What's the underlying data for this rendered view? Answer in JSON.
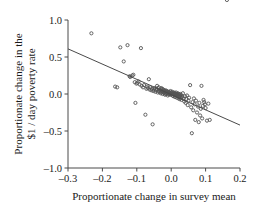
{
  "chart_data": {
    "type": "scatter",
    "title": "",
    "xlabel": "Proportionate change in survey mean",
    "ylabel_line1": "Proportionate change in the",
    "ylabel_line2": "$1 / day poverty rate",
    "xlim": [
      -0.3,
      0.2
    ],
    "ylim": [
      -1.0,
      1.0
    ],
    "xticks": [
      -0.3,
      -0.2,
      -0.1,
      0.0,
      0.1,
      0.2
    ],
    "xticklabels": [
      "–0.3",
      "–0.2",
      "–0.1",
      "0.0",
      "0.1",
      "0.2"
    ],
    "yticks": [
      -1.0,
      -0.5,
      0.0,
      0.5,
      1.0
    ],
    "yticklabels": [
      "–1.0",
      "–0.5",
      "0.0",
      "0.5",
      "1.0"
    ],
    "grid": false,
    "legend": null,
    "marker": "open-circle",
    "marker_color": "#555555",
    "line_color": "#4a4a4a",
    "fit_line": {
      "label": "regression line",
      "x_start": -0.3,
      "y_start": 0.61,
      "x_end": 0.2,
      "y_end": -0.42,
      "slope": -2.06,
      "intercept": -0.008
    },
    "x": [
      -0.232,
      -0.163,
      -0.157,
      -0.148,
      -0.138,
      -0.127,
      -0.121,
      -0.119,
      -0.113,
      -0.11,
      -0.106,
      -0.104,
      -0.101,
      -0.098,
      -0.095,
      -0.092,
      -0.088,
      -0.086,
      -0.082,
      -0.079,
      -0.075,
      -0.072,
      -0.07,
      -0.068,
      -0.065,
      -0.063,
      -0.061,
      -0.058,
      -0.056,
      -0.054,
      -0.052,
      -0.05,
      -0.048,
      -0.046,
      -0.044,
      -0.042,
      -0.041,
      -0.039,
      -0.037,
      -0.036,
      -0.034,
      -0.033,
      -0.031,
      -0.03,
      -0.029,
      -0.028,
      -0.027,
      -0.026,
      -0.025,
      -0.024,
      -0.023,
      -0.022,
      -0.021,
      -0.02,
      -0.019,
      -0.018,
      -0.017,
      -0.016,
      -0.015,
      -0.014,
      -0.013,
      -0.012,
      -0.011,
      -0.01,
      -0.009,
      -0.008,
      -0.007,
      -0.006,
      -0.005,
      -0.004,
      -0.003,
      -0.002,
      -0.001,
      0.0,
      0.001,
      0.002,
      0.003,
      0.004,
      0.005,
      0.006,
      0.007,
      0.008,
      0.009,
      0.01,
      0.011,
      0.012,
      0.013,
      0.014,
      0.015,
      0.016,
      0.017,
      0.018,
      0.019,
      0.02,
      0.021,
      0.022,
      0.023,
      0.024,
      0.025,
      0.026,
      0.027,
      0.028,
      0.029,
      0.03,
      0.032,
      0.034,
      0.036,
      0.038,
      0.04,
      0.042,
      0.044,
      0.046,
      0.048,
      0.05,
      0.052,
      0.055,
      0.058,
      0.06,
      0.062,
      0.064,
      0.066,
      0.068,
      0.07,
      0.072,
      0.075,
      0.078,
      0.08,
      0.082,
      0.084,
      0.086,
      0.088,
      0.09,
      0.092,
      0.094,
      0.096,
      0.098,
      0.1,
      0.104,
      0.108,
      0.112,
      0.162
    ],
    "y": [
      0.82,
      0.1,
      0.09,
      0.63,
      0.44,
      0.66,
      0.24,
      0.23,
      0.25,
      0.26,
      0.16,
      -0.12,
      0.14,
      0.15,
      0.17,
      0.13,
      0.62,
      0.11,
      0.09,
      0.12,
      -0.28,
      0.07,
      0.1,
      0.08,
      0.2,
      0.06,
      0.09,
      0.05,
      0.07,
      -0.41,
      0.04,
      0.06,
      0.08,
      0.03,
      0.05,
      0.07,
      0.11,
      0.02,
      0.04,
      0.09,
      0.03,
      0.06,
      0.01,
      0.05,
      0.08,
      0.02,
      0.04,
      0.07,
      0.0,
      0.03,
      0.06,
      0.02,
      0.05,
      0.01,
      0.04,
      -0.01,
      0.03,
      0.05,
      0.0,
      0.02,
      0.04,
      0.01,
      0.03,
      -0.02,
      0.02,
      0.0,
      0.03,
      0.01,
      -0.01,
      0.02,
      0.0,
      0.04,
      0.01,
      -0.01,
      0.02,
      0.0,
      0.03,
      -0.02,
      0.01,
      -0.03,
      0.0,
      0.02,
      -0.01,
      0.01,
      -0.04,
      0.0,
      -0.02,
      0.02,
      -0.01,
      -0.05,
      0.0,
      -0.03,
      0.01,
      -0.02,
      -0.06,
      0.0,
      -0.04,
      -0.01,
      -0.07,
      -0.03,
      0.0,
      -0.05,
      -0.02,
      -0.08,
      -0.04,
      0.01,
      -0.06,
      -0.1,
      -0.03,
      -0.12,
      -0.07,
      -0.02,
      -0.15,
      -0.09,
      -0.05,
      0.12,
      -0.18,
      -0.53,
      -0.11,
      -0.22,
      -0.06,
      -0.14,
      -0.35,
      -0.09,
      -0.25,
      -0.17,
      -0.38,
      -0.12,
      -0.29,
      -0.2,
      0.11,
      -0.33,
      -0.16,
      -0.08,
      -0.11,
      -0.14,
      -0.19,
      -0.36,
      -0.13,
      -0.35
    ]
  }
}
